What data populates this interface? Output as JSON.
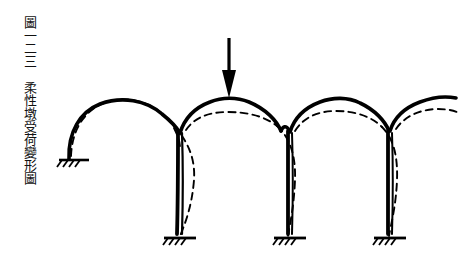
{
  "caption": {
    "figure_label": "圖",
    "figure_number": "一二三",
    "title": "柔性墩受荷變形圖",
    "full_text": "圖一二三　柔性墩受荷變形圖",
    "orientation": "vertical",
    "color": "#111111"
  },
  "figure": {
    "name": "flexible-pier-load-deformation-diagram",
    "line_color": "#000000",
    "background": "#ffffff",
    "original_shape_style": "solid",
    "deformed_shape_style": "dashed",
    "load_arrow": {
      "name": "vertical-load-arrow",
      "direction": "down",
      "x": 229,
      "tip_y": 95,
      "tail_y": 38
    },
    "arches": [
      {
        "name": "arch-left",
        "left_x": 68,
        "right_x": 180,
        "crown_y": 106,
        "springing_y": 160
      },
      {
        "name": "arch-center",
        "left_x": 180,
        "right_x": 290,
        "crown_y": 100,
        "springing_y": 132
      },
      {
        "name": "arch-right",
        "left_x": 290,
        "right_x": 390,
        "crown_y": 104,
        "springing_y": 132
      },
      {
        "name": "arch-stub-right",
        "left_x": 390,
        "right_x": 452,
        "crown_y": 100,
        "springing_y": 132
      }
    ],
    "piers": [
      {
        "name": "pier-1",
        "x": 180,
        "top_y": 130,
        "base_y": 238
      },
      {
        "name": "pier-2",
        "x": 290,
        "top_y": 130,
        "base_y": 238
      },
      {
        "name": "pier-3",
        "x": 390,
        "top_y": 130,
        "base_y": 238
      }
    ],
    "supports": [
      {
        "name": "support-abutment-left",
        "x": 68,
        "y": 160,
        "type": "fixed-hatched"
      },
      {
        "name": "support-pier-1",
        "x": 180,
        "y": 238,
        "type": "fixed-hatched"
      },
      {
        "name": "support-pier-2",
        "x": 290,
        "y": 238,
        "type": "fixed-hatched"
      },
      {
        "name": "support-pier-3",
        "x": 390,
        "y": 238,
        "type": "fixed-hatched"
      }
    ]
  }
}
